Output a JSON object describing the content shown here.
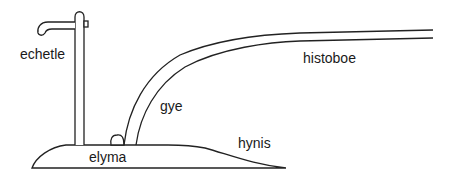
{
  "diagram": {
    "labels": {
      "echetle": "echetle",
      "histoboe": "histoboe",
      "gye": "gye",
      "elyma": "elyma",
      "hynis": "hynis"
    },
    "stroke_color": "#222222",
    "background": "#ffffff"
  }
}
